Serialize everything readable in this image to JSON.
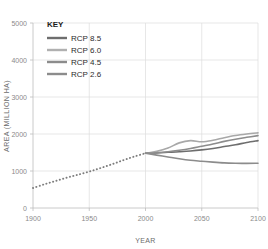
{
  "chart_data": {
    "type": "line",
    "title": "",
    "xlabel": "YEAR",
    "ylabel": "AREA (MILLION HA)",
    "xlim": [
      1900,
      2100
    ],
    "ylim": [
      0,
      5000
    ],
    "xticks": [
      1900,
      1950,
      2000,
      2050,
      2100
    ],
    "yticks": [
      0,
      1000,
      2000,
      3000,
      4000,
      5000
    ],
    "grid": true,
    "legend_title": "KEY",
    "legend_position": "top-left-inside",
    "historical": {
      "name": "Historical",
      "style": "dotted",
      "color": "#7d7d7d",
      "x": [
        1900,
        1910,
        1920,
        1930,
        1940,
        1950,
        1960,
        1970,
        1980,
        1990,
        2000
      ],
      "values": [
        540,
        640,
        730,
        820,
        900,
        985,
        1080,
        1180,
        1290,
        1390,
        1480
      ]
    },
    "series": [
      {
        "name": "RCP 8.5",
        "color": "#6e6e6e",
        "x": [
          2000,
          2010,
          2020,
          2030,
          2040,
          2050,
          2060,
          2070,
          2080,
          2090,
          2100
        ],
        "values": [
          1480,
          1490,
          1505,
          1520,
          1540,
          1570,
          1610,
          1660,
          1710,
          1770,
          1820
        ]
      },
      {
        "name": "RCP 6.0",
        "color": "#a8a8a8",
        "x": [
          2000,
          2010,
          2020,
          2030,
          2040,
          2050,
          2060,
          2070,
          2080,
          2090,
          2100
        ],
        "values": [
          1480,
          1530,
          1620,
          1760,
          1820,
          1790,
          1830,
          1900,
          1960,
          2000,
          2030
        ]
      },
      {
        "name": "RCP 4.5",
        "color": "#8c8c8c",
        "x": [
          2000,
          2010,
          2020,
          2030,
          2040,
          2050,
          2060,
          2070,
          2080,
          2090,
          2100
        ],
        "values": [
          1480,
          1495,
          1520,
          1560,
          1610,
          1670,
          1730,
          1800,
          1860,
          1910,
          1955
        ]
      },
      {
        "name": "RCP 2.6",
        "color": "#8c8c8c",
        "x": [
          2000,
          2010,
          2020,
          2030,
          2040,
          2050,
          2060,
          2070,
          2080,
          2090,
          2100
        ],
        "values": [
          1480,
          1430,
          1380,
          1330,
          1290,
          1265,
          1240,
          1220,
          1210,
          1205,
          1210
        ]
      }
    ]
  },
  "legend": {
    "title": "KEY",
    "items": [
      {
        "label": "RCP 8.5",
        "color": "#6e6e6e"
      },
      {
        "label": "RCP 6.0",
        "color": "#b0b0b0"
      },
      {
        "label": "RCP 4.5",
        "color": "#8c8c8c"
      },
      {
        "label": "RCP 2.6",
        "color": "#8c8c8c"
      }
    ]
  },
  "axes": {
    "x_title": "YEAR",
    "y_title": "AREA (MILLION HA)",
    "x_tick_labels": [
      "1900",
      "1950",
      "2000",
      "2050",
      "2100"
    ],
    "y_tick_labels": [
      "0",
      "1000",
      "2000",
      "3000",
      "4000",
      "5000"
    ]
  }
}
